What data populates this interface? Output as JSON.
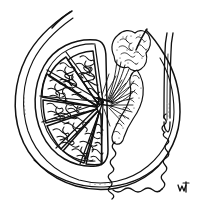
{
  "figure": {
    "title": "Testis and Epididymis in Opened Tunica Vaginalis",
    "style": "engraving-line-drawing",
    "background_color": "#ffffff",
    "ink_color": "#111111",
    "width": 198,
    "height": 210
  },
  "parts": [
    {
      "id": "tunica-vaginalis",
      "label": "Tunica vaginalis (opened sac)",
      "description": "Double-line outer sac enclosing the testis, drawn as two concentric curves open at the top"
    },
    {
      "id": "testis-body",
      "label": "Testis",
      "description": "Ovoid organ on the left filled with wedge-shaped lobules"
    },
    {
      "id": "tunica-albuginea",
      "label": "Tunica albuginea",
      "description": "Thick fibrous capsule drawn as the outline of the testis body"
    },
    {
      "id": "lobules",
      "label": "Lobules of testis",
      "description": "Radiating wedge compartments packed with squiggly seminiferous tubules",
      "count": 8
    },
    {
      "id": "seminiferous-tubules",
      "label": "Seminiferous tubules",
      "description": "Dense meandering coiled line texture filling each lobule"
    },
    {
      "id": "mediastinum-testis",
      "label": "Mediastinum testis / rete testis",
      "description": "Convergent hub of fine lines at the posterior center of the testis"
    },
    {
      "id": "efferent-ductules",
      "label": "Efferent ductules",
      "description": "Fan of fine lines leading from the rete testis up into the head of the epididymis"
    },
    {
      "id": "epididymis-head",
      "label": "Head of epididymis",
      "description": "Stippled lobed mass at the upper right of the testis"
    },
    {
      "id": "epididymis-body",
      "label": "Body of epididymis",
      "description": "Elongated stippled column descending along the posterior testis"
    },
    {
      "id": "epididymis-tail",
      "label": "Tail of epididymis",
      "description": "Long highly convoluted single duct looping across the bottom of the sac"
    },
    {
      "id": "vas-deferens",
      "label": "Vas deferens (ductus deferens)",
      "description": "Straight double-walled tube ascending on the right from the epididymal tail"
    },
    {
      "id": "spermatic-cord-edge",
      "label": "Cut edge of sac",
      "description": "Curved free edges of the opened tunica at the top of the figure"
    },
    {
      "id": "engraver-mark",
      "label": "Engraver's monogram",
      "description": "Small ink monogram mark in the lower right corner"
    }
  ],
  "engraver_mark": {
    "text": "",
    "position": "bottom-right"
  }
}
